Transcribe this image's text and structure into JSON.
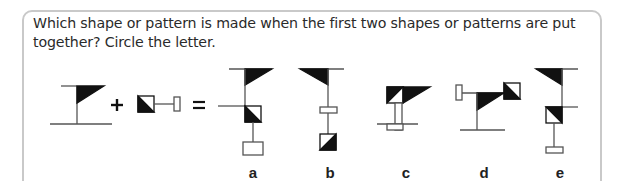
{
  "question": {
    "text": "Which shape or pattern is made when the first two shapes or patterns are put together? Circle the letter."
  },
  "equation": {
    "plus_sign": "+",
    "equals_sign": "=",
    "operand_1": "flag-on-post-shape",
    "operand_2": "half-shaded-square-with-bar-shape"
  },
  "options": [
    {
      "letter": "a",
      "shape": "option-a-shape"
    },
    {
      "letter": "b",
      "shape": "option-b-shape"
    },
    {
      "letter": "c",
      "shape": "option-c-shape"
    },
    {
      "letter": "d",
      "shape": "option-d-shape"
    },
    {
      "letter": "e",
      "shape": "option-e-shape"
    }
  ],
  "colors": {
    "border": "#c9c9c9",
    "ink": "#111111",
    "line": "#555555"
  }
}
